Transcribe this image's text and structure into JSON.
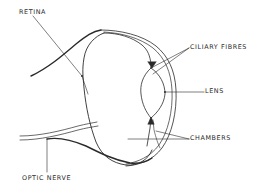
{
  "diagram": {
    "background": "#ffffff",
    "stroke_color": "#2a2a2a",
    "labels": {
      "retina": "RETINA",
      "ciliary_fibres": "CILIARY FIBRES",
      "lens": "LENS",
      "chambers": "CHAMBERS",
      "optic_nerve": "OPTIC NERVE"
    },
    "label_positions": {
      "retina": [
        19,
        9
      ],
      "ciliary_fibres": [
        190,
        44
      ],
      "lens": [
        205,
        88
      ],
      "chambers": [
        190,
        135
      ],
      "optic_nerve": [
        22,
        175
      ]
    }
  }
}
